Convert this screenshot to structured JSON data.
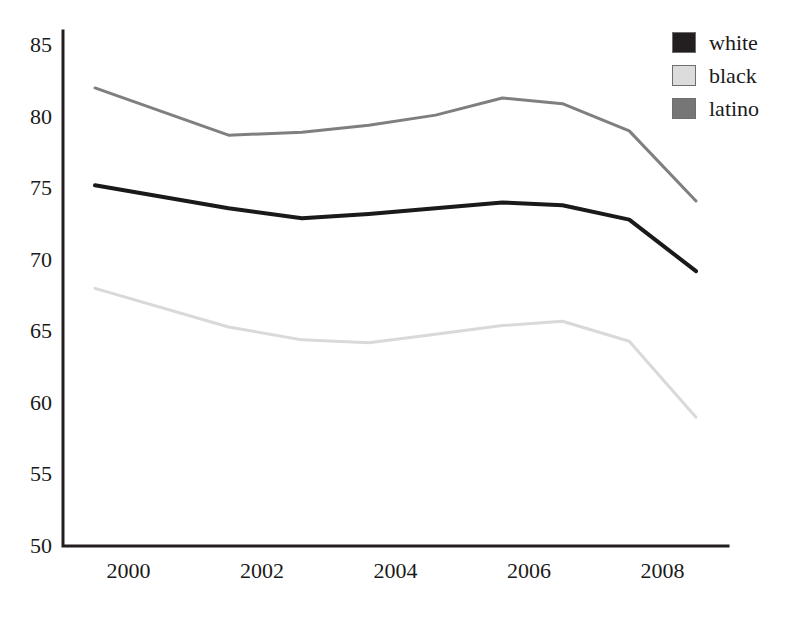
{
  "chart_data": {
    "type": "line",
    "title": "",
    "xlabel": "",
    "ylabel": "",
    "xlim": [
      1999.0,
      2009.0
    ],
    "ylim": [
      50,
      85
    ],
    "grid": false,
    "legend_position": "top-right",
    "xticks": [
      "2000",
      "2002",
      "2004",
      "2006",
      "2008"
    ],
    "xtick_values": [
      2000,
      2002,
      2004,
      2006,
      2008
    ],
    "yticks": [
      "50",
      "55",
      "60",
      "65",
      "70",
      "75",
      "80",
      "85"
    ],
    "ytick_values": [
      50,
      55,
      60,
      65,
      70,
      75,
      80,
      85
    ],
    "x": [
      1999.5,
      2001.5,
      2002.6,
      2003.6,
      2004.6,
      2005.6,
      2006.5,
      2007.5,
      2008.5
    ],
    "series": [
      {
        "name": "white",
        "color": "#1a1a1a",
        "width": 4,
        "values": [
          75.2,
          73.6,
          72.9,
          73.2,
          73.6,
          74.0,
          73.8,
          72.8,
          69.2
        ]
      },
      {
        "name": "black",
        "color": "#d9d9d9",
        "width": 3,
        "values": [
          68.0,
          65.3,
          64.4,
          64.2,
          64.8,
          65.4,
          65.7,
          64.3,
          59.0
        ]
      },
      {
        "name": "latino",
        "color": "#7f7f7f",
        "width": 3,
        "values": [
          82.0,
          78.7,
          78.9,
          79.4,
          80.1,
          81.3,
          80.9,
          79.0,
          74.1
        ]
      }
    ]
  },
  "legend": {
    "entries": [
      {
        "label": "white",
        "swatch_color": "#231f20"
      },
      {
        "label": "black",
        "swatch_color": "#dcdcdc"
      },
      {
        "label": "latino",
        "swatch_color": "#767676"
      }
    ]
  },
  "axis": {
    "y_labels": [
      "85",
      "80",
      "75",
      "70",
      "65",
      "60",
      "55",
      "50"
    ],
    "x_labels": [
      "2000",
      "2002",
      "2004",
      "2006",
      "2008"
    ]
  }
}
